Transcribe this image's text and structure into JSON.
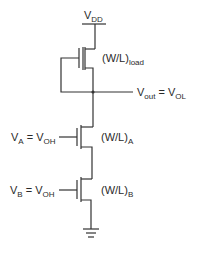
{
  "diagram": {
    "type": "circuit-schematic",
    "colors": {
      "wire": "#333333",
      "text": "#2a2a2a",
      "background": "#ffffff"
    },
    "supply": {
      "main": "V",
      "sub": "DD"
    },
    "load_transistor": {
      "label_main": "(W/L)",
      "label_sub": "load"
    },
    "output": {
      "main1": "V",
      "sub1": "out",
      "eq": " = ",
      "main2": "V",
      "sub2": "OL"
    },
    "input_a": {
      "main1": "V",
      "sub1": "A",
      "eq": " = ",
      "main2": "V",
      "sub2": "OH",
      "transistor_label_main": "(W/L)",
      "transistor_label_sub": "A"
    },
    "input_b": {
      "main1": "V",
      "sub1": "B",
      "eq": " = ",
      "main2": "V",
      "sub2": "OH",
      "transistor_label_main": "(W/L)",
      "transistor_label_sub": "B"
    },
    "ground": {
      "symbol": "ground-icon"
    }
  }
}
